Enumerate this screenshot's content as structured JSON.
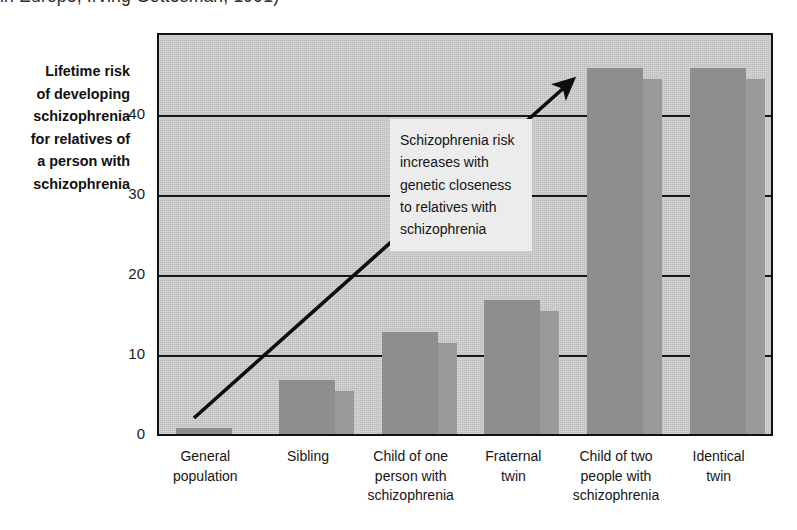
{
  "caption": "in Europe, Irving Gottesman, 1991)",
  "y_axis_label_lines": [
    "Lifetime risk",
    "of developing",
    "schizophrenia",
    "for relatives of",
    "a person with",
    "schizophrenia"
  ],
  "annotation_lines": [
    "Schizophrenia risk",
    "increases with",
    "genetic closeness",
    "to relatives with",
    "schizophrenia"
  ],
  "colors": {
    "plot_background": "#c9c9c9",
    "bar_main": "#8e8e8e",
    "bar_shadow": "#9a9a9a",
    "axis": "#111111",
    "annotation_background": "#ececec",
    "text": "#141414"
  },
  "chart_data": {
    "type": "bar",
    "title": "",
    "xlabel": "",
    "ylabel": "Lifetime risk of developing schizophrenia for relatives of a person with schizophrenia",
    "ylim": [
      0,
      50
    ],
    "yticks": [
      0,
      10,
      20,
      30,
      40
    ],
    "ytick_labels": [
      "0",
      "10",
      "20",
      "30",
      "40"
    ],
    "grid": true,
    "legend": "none",
    "categories": [
      "General population",
      "Sibling",
      "Child of one person with schizophrenia",
      "Fraternal twin",
      "Child of two people with schizophrenia",
      "Identical twin"
    ],
    "category_label_lines": [
      [
        "General",
        "population"
      ],
      [
        "Sibling"
      ],
      [
        "Child of one",
        "person with",
        "schizophrenia"
      ],
      [
        "Fraternal",
        "twin"
      ],
      [
        "Child of two",
        "people with",
        "schizophrenia"
      ],
      [
        "Identical",
        "twin"
      ]
    ],
    "values": [
      1,
      7,
      13,
      17,
      46,
      46
    ],
    "units": "percent",
    "annotations": [
      {
        "text": "Schizophrenia risk increases with genetic closeness to relatives with schizophrenia",
        "type": "textbox"
      },
      {
        "text": "",
        "type": "arrow",
        "from": [
          0.05,
          2.4
        ],
        "to": [
          6.1,
          44.5
        ]
      }
    ]
  }
}
